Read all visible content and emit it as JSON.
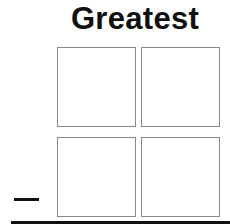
{
  "title": "Greatest",
  "operator": "−",
  "grid": {
    "rows": 2,
    "cols": 2,
    "cells": [
      "",
      "",
      "",
      ""
    ]
  },
  "colors": {
    "text": "#111111",
    "box_border": "#8a8a8a",
    "background": "#ffffff"
  }
}
